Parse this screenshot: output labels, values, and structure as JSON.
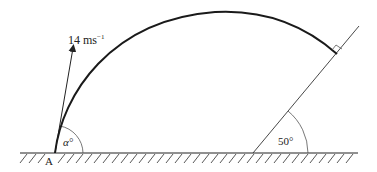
{
  "diagram": {
    "type": "projectile-onto-inclined-plane",
    "velocity_label": "14 ms",
    "velocity_exponent": "−1",
    "launch_angle_label": "α°",
    "incline_angle_label": "50°",
    "point_label": "A",
    "colors": {
      "line": "#222222",
      "trajectory": "#1a1a1a",
      "background": "#ffffff"
    }
  }
}
